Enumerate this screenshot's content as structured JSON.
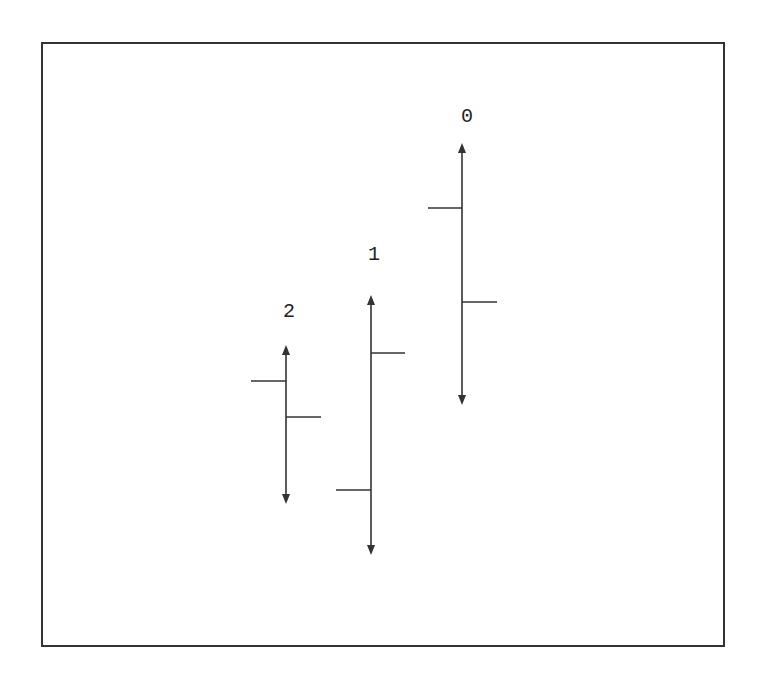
{
  "diagram": {
    "type": "ohlc-style vertical range glyphs",
    "frame": {
      "x": 41,
      "y": 42,
      "width": 682,
      "height": 603,
      "stroke": "#333333"
    },
    "stroke_color": "#333333",
    "glyphs": [
      {
        "label": "0",
        "label_pos": [
          467,
          117
        ],
        "x": 462,
        "top": 143,
        "bottom": 405,
        "left_tick": {
          "y": 208,
          "len": 34
        },
        "right_tick": {
          "y": 302,
          "len": 35
        }
      },
      {
        "label": "1",
        "label_pos": [
          374,
          255
        ],
        "x": 371,
        "top": 295,
        "bottom": 555,
        "left_tick": {
          "y": 490,
          "len": 35
        },
        "right_tick": {
          "y": 353,
          "len": 34
        }
      },
      {
        "label": "2",
        "label_pos": [
          289,
          312
        ],
        "x": 286,
        "top": 345,
        "bottom": 504,
        "left_tick": {
          "y": 381,
          "len": 35
        },
        "right_tick": {
          "y": 417,
          "len": 35
        }
      }
    ]
  },
  "chart_data": {
    "type": "ohlc",
    "categories": [
      "2",
      "1",
      "0"
    ],
    "note": "values in screen-y pixels (smaller = higher)",
    "series": [
      {
        "name": "high (arrow top)",
        "values": [
          345,
          295,
          143
        ]
      },
      {
        "name": "low (arrow bottom)",
        "values": [
          504,
          555,
          405
        ]
      },
      {
        "name": "open (left tick)",
        "values": [
          381,
          490,
          208
        ]
      },
      {
        "name": "close (right tick)",
        "values": [
          417,
          353,
          302
        ]
      }
    ],
    "title": "",
    "xlabel": "",
    "ylabel": "",
    "grid": false,
    "legend": "none"
  }
}
